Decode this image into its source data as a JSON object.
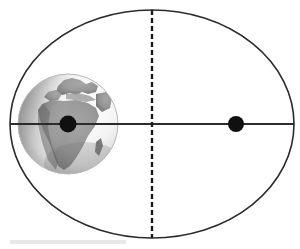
{
  "figure": {
    "background_color": "#ffffff",
    "width": 300,
    "height": 249
  },
  "diagram": {
    "type": "orbital-ellipse",
    "ellipse": {
      "name": "orbit-path",
      "center_x": 152,
      "center_y": 124,
      "radius_x": 142,
      "radius_y": 114,
      "stroke_color": "#2b2b2b",
      "stroke_width": 1.6,
      "fill": "none",
      "left_vertex_x": 10,
      "right_vertex_x": 294,
      "top_vertex_y": 10,
      "bottom_vertex_y": 238
    },
    "major_axis": {
      "name": "major-axis-line",
      "x1": 10,
      "y1": 124,
      "x2": 294,
      "y2": 124,
      "stroke_color": "#2b2b2b",
      "stroke_width": 2.2,
      "style": "solid"
    },
    "minor_axis": {
      "name": "minor-axis-line",
      "x1": 152,
      "y1": 10,
      "x2": 152,
      "y2": 238,
      "stroke_color": "#1a1a1a",
      "stroke_width": 2.4,
      "style": "dashed",
      "dash_length": 5,
      "dash_gap": 3
    },
    "focus_occupied": {
      "name": "focus-earth",
      "cx": 68,
      "cy": 124,
      "r": 8.5,
      "color": "#101010",
      "label": "occupied focus"
    },
    "focus_empty": {
      "name": "focus-empty",
      "cx": 236,
      "cy": 124,
      "r": 8,
      "color": "#101010",
      "label": "empty focus"
    },
    "earth": {
      "name": "earth-globe",
      "cx": 68,
      "cy": 124,
      "r": 50,
      "ocean_color": "#f2f2f2",
      "land_color": "#8e8e8e",
      "land_dark_color": "#6a6a6a",
      "shadow_color": "#555555",
      "rim_color": "#b8b8b8",
      "visible_region": "Africa and Europe"
    },
    "caption_bar": {
      "name": "caption-placeholder-bar",
      "x": 10,
      "y": 240,
      "width": 116,
      "height": 4,
      "color": "#e8e8e8"
    }
  }
}
